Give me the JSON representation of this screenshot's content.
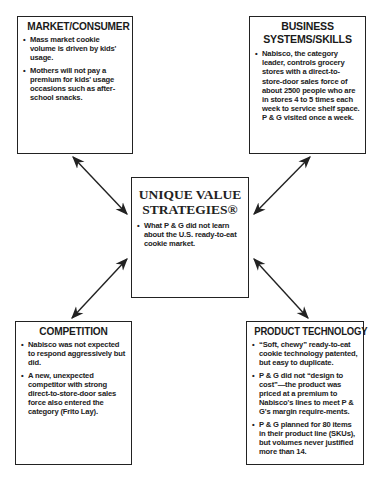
{
  "center": {
    "title_line1": "UNIQUE VALUE",
    "title_line2": "STRATEGIES®",
    "bullets": [
      "What P & G did not learn about the U.S. ready-to-eat cookie market."
    ]
  },
  "market_consumer": {
    "title": "MARKET/CONSUMER",
    "bullets": [
      "Mass market cookie volume is driven by kids' usage.",
      "Mothers will not pay a premium for kids' usage occasions such as after-school snacks."
    ]
  },
  "business_systems": {
    "title_line1": "BUSINESS",
    "title_line2": "SYSTEMS/SKILLS",
    "bullets": [
      "Nabisco, the category leader, controls grocery stores with a direct-to-store-door sales force of about 2500 people who are in stores 4 to 5 times each week to service shelf space. P & G visited once a week."
    ]
  },
  "competition": {
    "title": "COMPETITION",
    "bullets": [
      "Nabisco was not expected to respond aggressively but did.",
      "A new, unexpected competitor with strong direct-to-store-door sales force also entered the category (Frito Lay)."
    ]
  },
  "product_technology": {
    "title": "PRODUCT TECHNOLOGY",
    "bullets": [
      "“Soft, chewy” ready-to-eat cookie technology patented, but easy to duplicate.",
      "P & G did not “design to cost”—the product was priced at a premium to Nabisco's lines to meet P & G's margin require-ments.",
      "P & G planned for 80 items in their product line (SKUs), but volumes never justified more than 14."
    ]
  },
  "colors": {
    "line": "#222222",
    "background": "#ffffff"
  }
}
